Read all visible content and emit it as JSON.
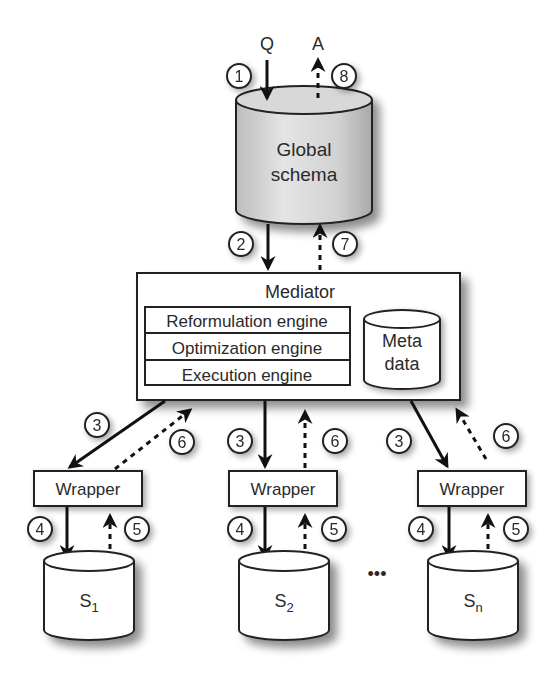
{
  "diagram": {
    "type": "mediator-wrapper data integration architecture",
    "top_labels": {
      "query": "Q",
      "answer": "A"
    },
    "global_schema": {
      "line1": "Global",
      "line2": "schema"
    },
    "mediator": {
      "title": "Mediator",
      "engines": [
        "Reformulation engine",
        "Optimization engine",
        "Execution engine"
      ],
      "metadata": {
        "line1": "Meta",
        "line2": "data"
      }
    },
    "wrappers": [
      {
        "label": "Wrapper"
      },
      {
        "label": "Wrapper"
      },
      {
        "label": "Wrapper"
      }
    ],
    "sources": [
      {
        "base": "S",
        "sub": "1"
      },
      {
        "base": "S",
        "sub": "2"
      },
      {
        "base": "S",
        "sub": "n"
      }
    ],
    "ellipsis": "•••",
    "steps": {
      "s1": "1",
      "s2": "2",
      "s3": "3",
      "s4": "4",
      "s5": "5",
      "s6": "6",
      "s7": "7",
      "s8": "8"
    }
  }
}
